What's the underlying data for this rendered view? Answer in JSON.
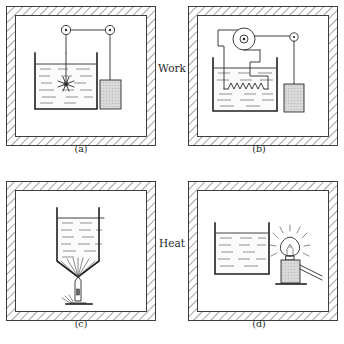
{
  "figure": {
    "background_color": "#ffffff",
    "ink_color": "#2a2a2a",
    "liquid_color": "#4a4a4a",
    "weight_fill_color": "#d2d2d2",
    "wall_hatch_color": "#555555"
  },
  "process_labels": [
    {
      "id": "work",
      "text": "Work",
      "x": 172,
      "y": 72
    },
    {
      "id": "heat",
      "text": "Heat",
      "x": 172,
      "y": 247
    }
  ],
  "panels": [
    {
      "id": "a",
      "caption": "(a)",
      "process": "Work",
      "mechanism": "falling-weight paddle-wheel stirrer",
      "components": [
        "insulated-wall",
        "beaker",
        "liquid",
        "paddle-wheel",
        "pulley-left",
        "pulley-right",
        "cord",
        "weight"
      ],
      "caption_x": 78,
      "caption_y": 152
    },
    {
      "id": "b",
      "caption": "(b)",
      "process": "Work",
      "mechanism": "falling-weight dynamo driving a resistance coil",
      "components": [
        "insulated-wall",
        "beaker",
        "liquid",
        "resistance-coil",
        "dynamo-pulley",
        "pulley-right",
        "cord",
        "lead-wires",
        "weight"
      ],
      "caption_x": 259,
      "caption_y": 152
    },
    {
      "id": "c",
      "caption": "(c)",
      "process": "Heat",
      "mechanism": "bunsen burner flame heating the beaker",
      "components": [
        "insulated-wall",
        "beaker",
        "liquid",
        "burner-tube",
        "burner-base",
        "flame-rays"
      ],
      "caption_x": 78,
      "caption_y": 327
    },
    {
      "id": "d",
      "caption": "(d)",
      "process": "Heat",
      "mechanism": "incandescent lamp radiating onto the beaker",
      "components": [
        "insulated-wall",
        "beaker",
        "liquid",
        "lamp-bulb",
        "lamp-filament",
        "lamp-base",
        "radiation-rays",
        "lead-wires"
      ],
      "caption_x": 259,
      "caption_y": 327
    }
  ]
}
